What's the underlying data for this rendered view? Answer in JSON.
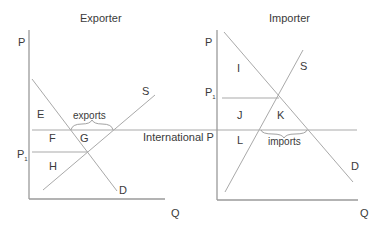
{
  "diagram": {
    "type": "supply-demand-trade",
    "colors": {
      "line": "#a9a9a9",
      "axis": "#9a9a9a",
      "text": "#3a3a3a",
      "background": "#ffffff"
    },
    "shared": {
      "world_price_label": "International P"
    },
    "exporter": {
      "title": "Exporter",
      "y_axis_label": "P",
      "x_axis_label": "Q",
      "autarky_price_label": "P",
      "autarky_price_subscript": "1",
      "supply_label": "S",
      "demand_label": "D",
      "quantity_label": "exports",
      "regions": {
        "E": "E",
        "F": "F",
        "G": "G",
        "H": "H"
      }
    },
    "importer": {
      "title": "Importer",
      "y_axis_label": "P",
      "x_axis_label": "Q",
      "autarky_price_label": "P",
      "autarky_price_subscript": "1",
      "supply_label": "S",
      "demand_label": "D",
      "quantity_label": "imports",
      "regions": {
        "I": "I",
        "J": "J",
        "K": "K",
        "L": "L"
      }
    }
  }
}
